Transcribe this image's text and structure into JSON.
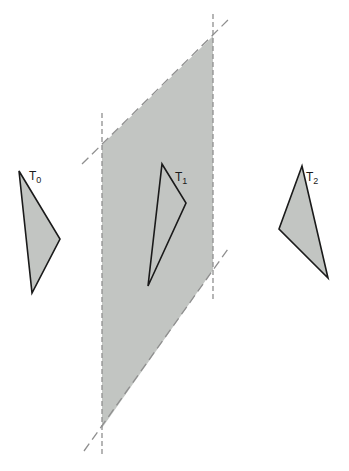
{
  "canvas": {
    "width": 349,
    "height": 471,
    "background": "#ffffff"
  },
  "colors": {
    "plane_fill": "#c2c5c2",
    "triangle_fill": "#c2c5c2",
    "triangle_stroke": "#1a1a1a",
    "dashed_line": "#8f8f8f"
  },
  "plane": {
    "points": "102,145 213,36 213,270 102,428"
  },
  "dashed_lines": [
    {
      "name": "plane-edge-left-vertical-dashed-line",
      "x1": 102,
      "y1": 113,
      "x2": 102,
      "y2": 457,
      "dash": "5 3"
    },
    {
      "name": "plane-edge-right-vertical-dashed-line",
      "x1": 213,
      "y1": 14,
      "x2": 213,
      "y2": 300,
      "dash": "5 3"
    },
    {
      "name": "plane-edge-top-diagonal-dashed-line",
      "x1": 82,
      "y1": 164,
      "x2": 229,
      "y2": 19,
      "dash": "9 5"
    },
    {
      "name": "plane-edge-bottom-diagonal-dashed-line",
      "x1": 84,
      "y1": 451,
      "x2": 228,
      "y2": 249,
      "dash": "9 5"
    }
  ],
  "triangles": [
    {
      "name": "triangle-T0",
      "label": "T",
      "subscript": "0",
      "points": "19,171 60,239 32,293",
      "label_x": 29,
      "label_y": 180
    },
    {
      "name": "triangle-T1",
      "label": "T",
      "subscript": "1",
      "points": "162,164 186,203 148,286",
      "label_x": 175,
      "label_y": 181
    },
    {
      "name": "triangle-T2",
      "label": "T",
      "subscript": "2",
      "points": "302,166 279,229 328,278",
      "label_x": 306,
      "label_y": 181
    }
  ]
}
